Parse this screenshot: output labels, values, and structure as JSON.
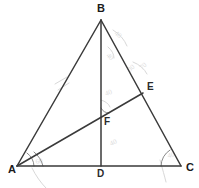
{
  "figure": {
    "background_color": "#ffffff",
    "line_color": "#3a3a3a",
    "arc_color": "#8a8a8a",
    "faint_pencil_color": "#d8d8d8",
    "width": 199,
    "height": 188
  },
  "points": {
    "A": {
      "label": "A",
      "x": 17,
      "y": 166,
      "label_x": 8,
      "label_y": 173
    },
    "B": {
      "label": "B",
      "x": 101,
      "y": 20,
      "label_x": 97,
      "label_y": 12
    },
    "C": {
      "label": "C",
      "x": 181,
      "y": 166,
      "label_x": 186,
      "label_y": 171
    },
    "D": {
      "label": "D",
      "x": 101,
      "y": 166,
      "label_x": 97,
      "label_y": 177
    },
    "E": {
      "label": "E",
      "x": 143,
      "y": 93,
      "label_x": 147,
      "label_y": 90
    },
    "F": {
      "label": "F",
      "x": 101,
      "y": 117,
      "label_x": 104,
      "label_y": 125
    }
  },
  "segments": [
    {
      "name": "side-AB",
      "from": "A",
      "to": "B"
    },
    {
      "name": "side-BC",
      "from": "B",
      "to": "C"
    },
    {
      "name": "side-AC",
      "from": "A",
      "to": "C"
    },
    {
      "name": "cevian-BD",
      "from": "B",
      "to": "D"
    },
    {
      "name": "cevian-AE",
      "from": "A",
      "to": "E"
    }
  ],
  "angle_marks": [
    {
      "name": "angle-arc-at-A-outer",
      "vertex": "A",
      "radius": 26
    },
    {
      "name": "angle-arc-at-A-inner",
      "vertex": "A",
      "radius": 17
    },
    {
      "name": "angle-arc-at-C",
      "vertex": "C",
      "radius": 20
    },
    {
      "name": "angle-arc-at-F",
      "vertex": "F",
      "radius": 9
    }
  ],
  "pencil_annotations": [
    {
      "name": "erased-mark-near-B",
      "text": "40"
    },
    {
      "name": "erased-mark-upper-right",
      "text": "30"
    },
    {
      "name": "erased-mark-near-E",
      "text": "70"
    },
    {
      "name": "erased-mark-near-F",
      "text": "40"
    },
    {
      "name": "erased-mark-on-AB",
      "text": ""
    },
    {
      "name": "erased-mark-near-D",
      "text": "40"
    },
    {
      "name": "erased-mark-near-A",
      "text": "60"
    },
    {
      "name": "erased-mark-near-C",
      "text": "40"
    }
  ]
}
